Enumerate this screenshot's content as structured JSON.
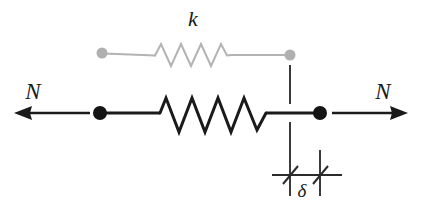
{
  "figure": {
    "type": "mechanics-free-body-diagram",
    "background_color": "#ffffff"
  },
  "labels": {
    "spring_constant": "k",
    "force_left": "N",
    "force_right": "N",
    "elongation": "δ"
  },
  "colors": {
    "undeformed": "#b3b3b3",
    "deformed": "#1a1a1a",
    "dimension": "#2b2b2b",
    "background": "#ffffff"
  },
  "geometry": {
    "undeformed": {
      "left_node_x": 102,
      "left_node_y": 53,
      "right_node_x": 290,
      "right_node_y": 55,
      "node_radius": 5.5,
      "coil_start_x": 155,
      "coil_end_x": 232,
      "coil_peaks": 4,
      "coil_amplitude": 17,
      "stroke_width": 2
    },
    "deformed": {
      "left_node_x": 100,
      "left_node_y": 113,
      "right_node_x": 320,
      "right_node_y": 113,
      "node_radius": 7,
      "coil_start_x": 160,
      "coil_end_x": 266,
      "coil_peaks": 4,
      "coil_amplitude": 22,
      "stroke_width": 3
    },
    "arrow_left": {
      "tail_x": 90,
      "tip_x": 18,
      "y": 113
    },
    "arrow_right": {
      "tail_x": 332,
      "tip_x": 404,
      "y": 113
    },
    "dimension": {
      "left_extension_x": 290,
      "right_extension_x": 320,
      "dim_line_y": 175,
      "dim_line_from_x": 272,
      "dim_line_to_x": 340,
      "left_ext_top_y": 65,
      "left_ext_bottom_y": 196,
      "right_ext_top_y": 150,
      "right_ext_bottom_y": 196
    }
  },
  "label_positions": {
    "k": {
      "x": 193,
      "y": 26
    },
    "N_left": {
      "x": 33,
      "y": 99
    },
    "N_right": {
      "x": 383,
      "y": 99
    },
    "delta": {
      "x": 302,
      "y": 196
    }
  },
  "annotations": {
    "undeformed_description": "Light gray spring in its unstretched reference state with two small round end nodes.",
    "deformed_description": "Heavy black spring stretched between two filled round nodes, loaded by equal and opposite forces N.",
    "dimension_description": "Dimension callout with two vertical extension lines, a horizontal dimension line and oblique slash ticks marking the elongation delta."
  }
}
